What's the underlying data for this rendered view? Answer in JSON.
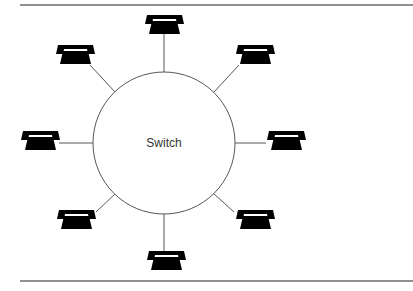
{
  "diagram": {
    "type": "star-topology",
    "center": {
      "label": "Switch",
      "cx": 164,
      "cy": 143,
      "r": 71
    },
    "rules": {
      "top_y": 5,
      "bottom_y": 281,
      "x_start": 20,
      "x_end": 413
    },
    "nodes": [
      {
        "id": "phone-top",
        "icon": "telephone-icon",
        "x": 144,
        "y": 15,
        "wire": [
          164,
          34,
          164,
          72
        ]
      },
      {
        "id": "phone-upper-right",
        "icon": "telephone-icon",
        "x": 235,
        "y": 45,
        "wire": [
          239,
          65,
          214,
          92
        ]
      },
      {
        "id": "phone-right",
        "icon": "telephone-icon",
        "x": 266,
        "y": 131,
        "wire": [
          266,
          143,
          235,
          143
        ]
      },
      {
        "id": "phone-lower-right",
        "icon": "telephone-icon",
        "x": 235,
        "y": 210,
        "wire": [
          234,
          212,
          213,
          193
        ]
      },
      {
        "id": "phone-bottom",
        "icon": "telephone-icon",
        "x": 146,
        "y": 251,
        "wire": [
          164,
          214,
          164,
          252
        ]
      },
      {
        "id": "phone-lower-left",
        "icon": "telephone-icon",
        "x": 56,
        "y": 210,
        "wire": [
          96,
          212,
          116,
          193
        ]
      },
      {
        "id": "phone-left",
        "icon": "telephone-icon",
        "x": 20,
        "y": 131,
        "wire": [
          59,
          143,
          93,
          143
        ]
      },
      {
        "id": "phone-upper-left",
        "icon": "telephone-icon",
        "x": 55,
        "y": 45,
        "wire": [
          90,
          65,
          115,
          92
        ]
      }
    ]
  }
}
